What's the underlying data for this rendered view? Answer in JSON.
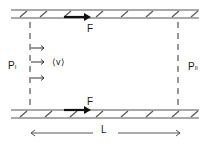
{
  "diagram": {
    "type": "flow between parallel plates",
    "labels": {
      "force_top": "F",
      "force_bottom": "F",
      "pressure_left": "P",
      "pressure_left_sub": "I",
      "pressure_right": "P",
      "pressure_right_sub": "II",
      "velocity": "⟨v⟩",
      "length": "L"
    },
    "colors": {
      "line": "#1a1a1a",
      "wall": "#555555",
      "background": "#ffffff"
    }
  }
}
